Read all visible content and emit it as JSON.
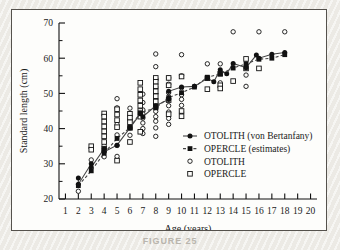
{
  "figure": {
    "caption": "FIGURE 25"
  },
  "chart_data": {
    "type": "scatter",
    "title": "",
    "xlabel": "Age (years)",
    "ylabel": "Standard length (cm)",
    "xlim": [
      0.5,
      20.5
    ],
    "ylim": [
      20,
      70
    ],
    "xticks": [
      1,
      2,
      3,
      4,
      5,
      6,
      7,
      8,
      9,
      10,
      11,
      12,
      13,
      14,
      15,
      16,
      17,
      18,
      19,
      20
    ],
    "xtick_labels": [
      "1",
      "2",
      "3",
      "4",
      "5",
      "6",
      "7",
      "8",
      "9",
      "10",
      "11",
      "12",
      "13",
      "14",
      "15",
      "16",
      "17",
      "18",
      "19",
      "20"
    ],
    "yticks": [
      20,
      30,
      40,
      50,
      60,
      70
    ],
    "ytick_labels": [
      "20",
      "30",
      "40",
      "50",
      "60",
      "70"
    ],
    "yminorticks": [
      25,
      35,
      45,
      55,
      65
    ],
    "grid": false,
    "legend_position": "center-right",
    "legend": [
      {
        "label": "OTOLITH (von Bertanfany)",
        "marker": "filled-circle",
        "line": "solid"
      },
      {
        "label": "OPERCLE (estimates)",
        "marker": "filled-square",
        "line": "dashed"
      },
      {
        "label": "OTOLITH",
        "marker": "open-circle",
        "line": "none"
      },
      {
        "label": "OPERCLE",
        "marker": "open-square",
        "line": "none"
      }
    ],
    "series": [
      {
        "name": "OTOLITH (von Bertanfany)",
        "marker": "filled-circle",
        "line": "solid",
        "x": [
          2,
          2,
          3,
          3,
          4,
          4,
          5,
          6,
          6.8,
          7,
          8,
          9,
          9,
          10,
          11,
          12,
          12.5,
          13,
          13.5,
          14,
          15,
          15.8,
          16,
          17,
          18
        ],
        "y": [
          26.0,
          24.2,
          30.0,
          29.0,
          34.3,
          33.4,
          35.3,
          40.2,
          44.2,
          43.4,
          46.5,
          48.3,
          50.6,
          51.8,
          52.0,
          54.3,
          53.3,
          56.7,
          55.6,
          58.5,
          57.3,
          60.9,
          60.0,
          61.1,
          61.6
        ]
      },
      {
        "name": "OPERCLE (estimates)",
        "marker": "filled-square",
        "line": "dashed",
        "x": [
          2,
          3,
          4,
          5,
          6,
          6.8,
          8,
          9,
          10,
          11,
          12,
          13,
          14,
          15,
          16,
          17,
          18
        ],
        "y": [
          23.8,
          28.0,
          33.0,
          37.2,
          40.3,
          44.5,
          45.9,
          48.8,
          50.2,
          51.8,
          54.6,
          55.5,
          57.2,
          58.4,
          59.7,
          60.0,
          61.0
        ]
      },
      {
        "name": "OTOLITH",
        "marker": "open-circle",
        "line": "none",
        "x": [
          2,
          3,
          4,
          4,
          4,
          5,
          5,
          5,
          5,
          5,
          5,
          6,
          6,
          6,
          7,
          7,
          7,
          7,
          7,
          7,
          7,
          7,
          8,
          8,
          8,
          8,
          8,
          8,
          8,
          8,
          8,
          8,
          8,
          8,
          8,
          9,
          9,
          9,
          9,
          9,
          9,
          9,
          9,
          10,
          10,
          10,
          10,
          10,
          10,
          10,
          11,
          12,
          13,
          13,
          14,
          15,
          15,
          16,
          18
        ],
        "y": [
          22.2,
          31.1,
          35.2,
          33.6,
          32.0,
          48.5,
          45.9,
          41.2,
          38.2,
          35.2,
          32.1,
          45.8,
          42.6,
          38.1,
          49.8,
          47.4,
          45.3,
          44.2,
          43.0,
          41.6,
          40.0,
          38.6,
          61.2,
          57.6,
          54.2,
          51.8,
          49.9,
          48.4,
          47.2,
          46.1,
          44.9,
          43.4,
          42.1,
          40.2,
          37.8,
          54.4,
          52.6,
          50.2,
          48.5,
          46.5,
          44.7,
          42.9,
          41.2,
          61.0,
          55.0,
          51.6,
          49.6,
          48.3,
          46.6,
          44.7,
          52.0,
          58.4,
          58.4,
          53.0,
          67.5,
          55.2,
          52.0,
          67.5,
          67.5
        ]
      },
      {
        "name": "OPERCLE",
        "marker": "open-square",
        "line": "none",
        "x": [
          3,
          3,
          4,
          4,
          4,
          4,
          4,
          4,
          4,
          4,
          5,
          5,
          5,
          5,
          5,
          6,
          6,
          6,
          6,
          6,
          6.8,
          6.8,
          6.8,
          6.8,
          6.8,
          6.8,
          6.8,
          6.8,
          8,
          8,
          8,
          8,
          8,
          8,
          8,
          9,
          9,
          9,
          9,
          10,
          10,
          10,
          12,
          12,
          13,
          13,
          13,
          14,
          15,
          15,
          16
        ],
        "y": [
          35.0,
          34.0,
          44.3,
          43.4,
          42.0,
          40.6,
          39.2,
          37.8,
          36.2,
          34.3,
          45.5,
          44.0,
          42.4,
          40.4,
          30.9,
          44.2,
          43.1,
          41.8,
          40.2,
          36.2,
          53.0,
          51.2,
          49.6,
          48.0,
          46.5,
          45.0,
          43.4,
          39.1,
          54.4,
          53.3,
          52.0,
          50.6,
          49.2,
          47.7,
          46.2,
          54.4,
          52.3,
          48.1,
          44.1,
          54.8,
          45.0,
          43.5,
          54.3,
          51.2,
          55.6,
          52.3,
          51.4,
          53.5,
          59.8,
          57.1,
          57.1
        ]
      }
    ]
  }
}
